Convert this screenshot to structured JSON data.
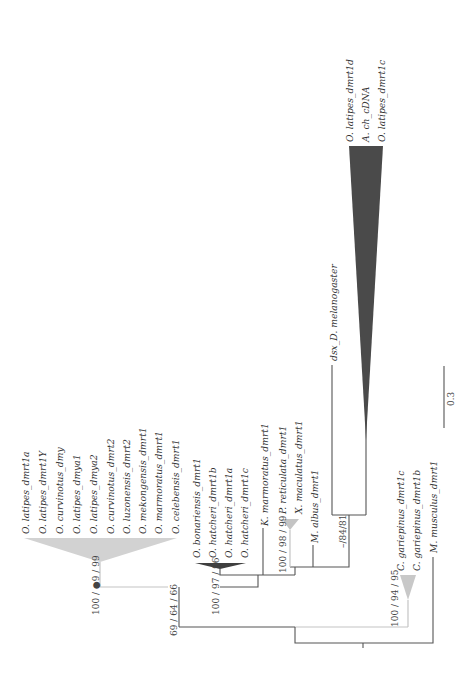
{
  "figure": {
    "type": "phylogenetic-tree",
    "orientation": "rotated 90 degrees (root at bottom, tips at top)",
    "scale_bar": {
      "label": "0.3"
    }
  },
  "colors": {
    "branch": "#555555",
    "light_branch": "#c4c4c4",
    "light_clade": "#cfcfcf",
    "dark_clade": "#4a4a4a"
  },
  "clades": {
    "oryzias_dmrt1a_group": {
      "support": "100 / ●9 / 99",
      "taxa": [
        "O. latipes_dmrt1a",
        "O. latipes_dmrt1Y",
        "O. curvinotus_dmy",
        "O. latipes_dmya1",
        "O. latipes_dmya2",
        "O. curvinotus_dmrt2",
        "O. luzonensis_dmrt2",
        "O. mekongensis_dmrt1",
        "O. marmoratus_dmrt1",
        "O. celebensis_dmrt1"
      ]
    },
    "outer_node": {
      "support": "69 / 64 / 66"
    },
    "hatcheri_group": {
      "support": "100 / 97 / 96",
      "taxa": [
        "O. bonariensis_dmrt1",
        "O. hatcheri_dmrt1b",
        "O. hatcheri_dmrt1a",
        "O. hatcheri_dmrt1c"
      ]
    },
    "k_marmoratus": {
      "taxa": [
        "K. marmoratus_dmrt1"
      ]
    },
    "poecilid_group": {
      "support": "100 / 98 / 99",
      "taxa": [
        "P. reticulata_dmrt1",
        "X. maculatus_dmrt1"
      ]
    },
    "m_albus": {
      "taxa": [
        "M. albus_dmrt1"
      ]
    },
    "insect_medaka_group": {
      "support": "–/84/81",
      "dsx": "dsx_D. melanogaster",
      "taxa": [
        "O. latipes_dmrt1d",
        "A. ch_cDNA",
        "O. latipes_dmrt1c"
      ]
    },
    "catfish_group": {
      "support": "100 / 94 / 95",
      "taxa": [
        "C. gariepinus_dmrt1c",
        "C. gariepinus_dmrt1b"
      ]
    },
    "outgroup": {
      "taxa": [
        "M. musculus_dmrt1"
      ]
    }
  }
}
